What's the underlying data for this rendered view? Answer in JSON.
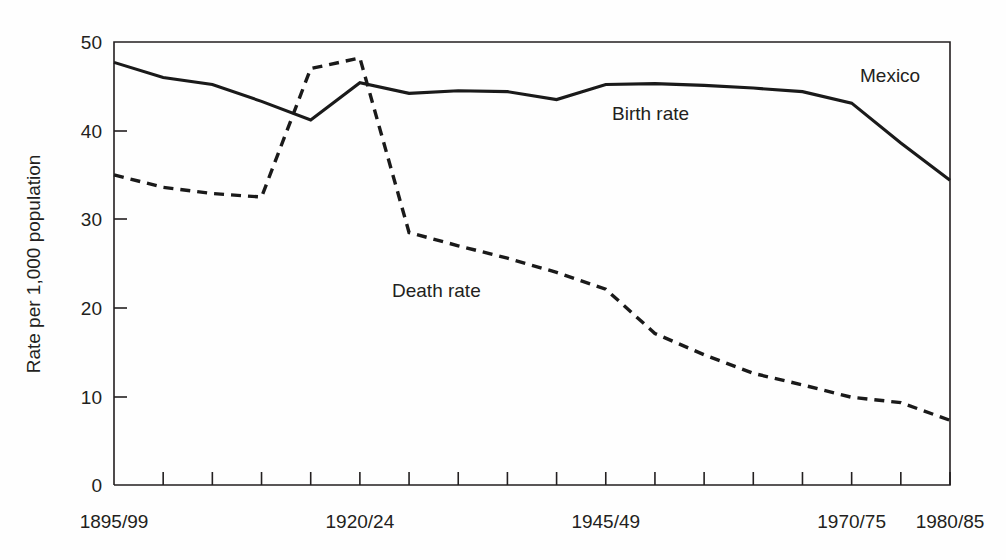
{
  "chart_data": {
    "type": "line",
    "title": "",
    "subtitle": "",
    "annotation_region": "Mexico",
    "xlabel": "",
    "ylabel": "Rate per 1,000 population",
    "ylim": [
      0,
      50
    ],
    "yticks": [
      0,
      10,
      20,
      30,
      40,
      50
    ],
    "ytick_labels": [
      "0",
      "10",
      "20",
      "30",
      "40",
      "50"
    ],
    "grid": false,
    "legend_position": "inline-annotations",
    "x_labeled_ticks": [
      "1895/99",
      "1920/24",
      "1945/49",
      "1970/75",
      "1980/85"
    ],
    "x_labeled_tick_index": [
      0,
      5,
      10,
      15,
      17
    ],
    "categories": [
      "1895/99",
      "1900/04",
      "1905/09",
      "1910/14",
      "1915/19",
      "1920/24",
      "1925/29",
      "1930/34",
      "1935/39",
      "1940/44",
      "1945/49",
      "1950/54",
      "1955/59",
      "1960/64",
      "1965/69",
      "1970/75",
      "1975/80",
      "1980/85"
    ],
    "series": [
      {
        "name": "Birth rate",
        "style": "solid",
        "label_x_index": 11,
        "values": [
          47.7,
          46.0,
          45.2,
          43.3,
          41.2,
          45.4,
          44.2,
          44.5,
          44.4,
          43.5,
          45.2,
          45.3,
          45.1,
          44.8,
          44.4,
          43.1,
          38.6,
          34.4
        ]
      },
      {
        "name": "Death rate",
        "style": "dashed",
        "label_x_index": 8,
        "values": [
          35.0,
          33.6,
          32.9,
          32.5,
          47.0,
          48.2,
          28.5,
          27.0,
          25.6,
          24.0,
          22.1,
          17.1,
          14.7,
          12.6,
          11.3,
          9.9,
          9.3,
          7.3
        ]
      }
    ]
  },
  "axes": {
    "y_axis_title": "Rate per 1,000 population"
  },
  "annotations": {
    "mexico_label": "Mexico",
    "birth_rate_label": "Birth rate",
    "death_rate_label": "Death rate"
  },
  "colors": {
    "ink": "#231f20",
    "line": "#1a1a1a",
    "background": "#ffffff"
  }
}
